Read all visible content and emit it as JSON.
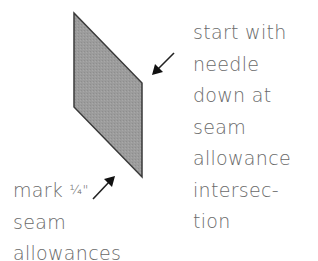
{
  "diagram": {
    "shape": {
      "type": "parallelogram",
      "fill": "#9a9a9a",
      "stroke": "#333333",
      "points": [
        [
          74,
          13
        ],
        [
          142,
          83
        ],
        [
          142,
          177
        ],
        [
          74,
          107
        ]
      ]
    },
    "arrows": [
      {
        "name": "needle-arrow",
        "from": [
          174,
          53
        ],
        "to": [
          152,
          75
        ]
      },
      {
        "name": "seam-arrow",
        "from": [
          93,
          199
        ],
        "to": [
          115,
          176
        ]
      }
    ],
    "right_label": {
      "lines": [
        "start with",
        "needle",
        "down at",
        "seam",
        "allowance",
        "intersec-",
        "tion"
      ]
    },
    "left_label": {
      "line1_word": "mark",
      "line1_fraction": "¼\"",
      "lines": [
        "seam",
        "allowances"
      ]
    }
  }
}
